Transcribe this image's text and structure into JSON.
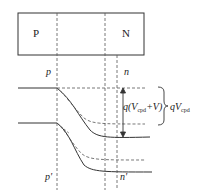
{
  "diagram": {
    "box_labels": {
      "p_region": "P",
      "n_region": "N"
    },
    "boundary_labels": {
      "p_top": "p",
      "n_top": "n",
      "p_bottom": "p'",
      "n_bottom": "n'"
    },
    "annotations": {
      "inner_q": "q(",
      "inner_v": "V",
      "inner_sub": "cpd",
      "inner_rest": "+V)",
      "outer_q": "q",
      "outer_v": "V",
      "outer_sub": "cpd"
    },
    "colors": {
      "line": "#333333",
      "dashed": "#555555",
      "background": "#ffffff"
    }
  }
}
